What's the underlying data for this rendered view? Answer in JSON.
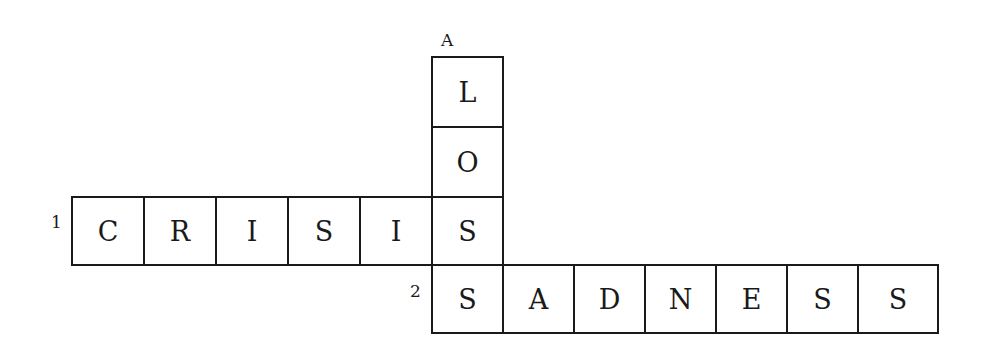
{
  "puzzle": {
    "type": "crossword",
    "down": [
      {
        "label": "A",
        "answer": "LOSS",
        "letters": [
          "L",
          "O",
          "S",
          "S"
        ]
      }
    ],
    "across": [
      {
        "label": "1",
        "answer": "CRISIS",
        "letters": [
          "C",
          "R",
          "I",
          "S",
          "I",
          "S"
        ]
      },
      {
        "label": "2",
        "answer": "SADNESS",
        "letters": [
          "S",
          "A",
          "D",
          "N",
          "E",
          "S",
          "S"
        ]
      }
    ]
  }
}
